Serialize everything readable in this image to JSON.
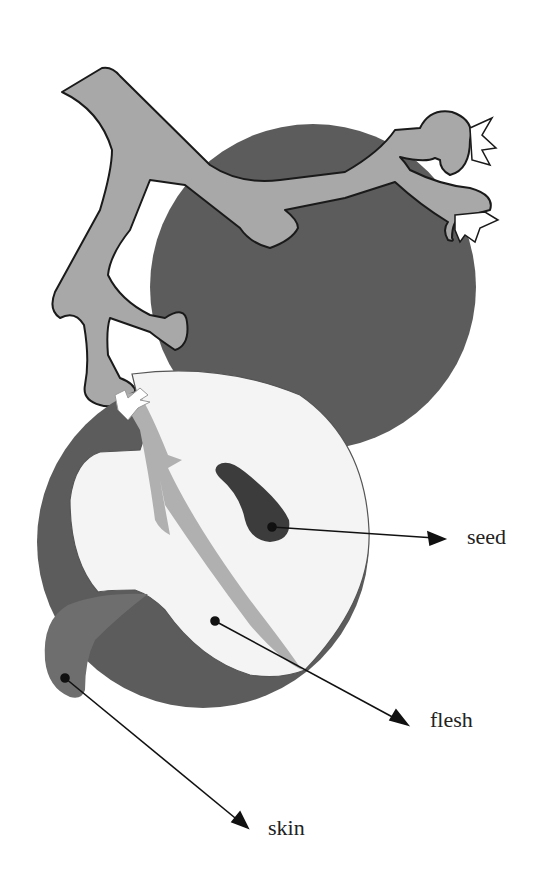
{
  "diagram": {
    "labels": {
      "seed": "seed",
      "flesh": "flesh",
      "skin": "skin"
    },
    "colors": {
      "background": "#ffffff",
      "skin_dark": "#5c5c5c",
      "stem": "#a8a8a8",
      "flesh": "#f4f4f4",
      "seed": "#3c3c3c",
      "vein": "#b0b0b0",
      "peel_flap": "#6e6e6e",
      "outline": "#1a1a1a"
    }
  }
}
